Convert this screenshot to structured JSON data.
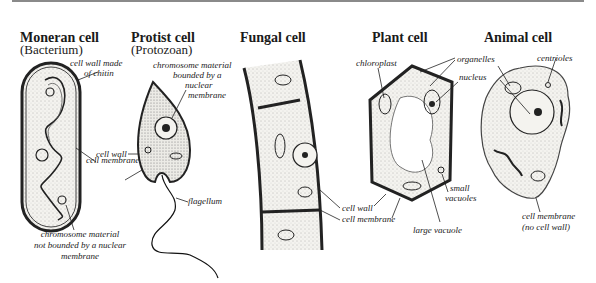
{
  "figure": {
    "panels": [
      {
        "title": "Moneran cell",
        "subtitle": "(Bacterium)",
        "labels": [
          "cell wall made",
          "of chitin",
          "chromosome material",
          "not bounded by a nuclear",
          "membrane"
        ]
      },
      {
        "title": "Protist cell",
        "subtitle": "(Protozoan)",
        "labels": [
          "chromosome material",
          "bounded by a",
          "nuclear",
          "membrane",
          "cell wall",
          "cell membrane",
          "flagellum"
        ]
      },
      {
        "title": "Fungal cell",
        "labels": [
          "cell wall",
          "cell membrane"
        ]
      },
      {
        "title": "Plant cell",
        "labels": [
          "chloroplast",
          "organelles",
          "nucleus",
          "small",
          "vacuoles",
          "large vacuole"
        ]
      },
      {
        "title": "Animal cell",
        "labels": [
          "centrioles",
          "cell membrane",
          "(no cell wall)"
        ]
      }
    ]
  },
  "colors": {
    "ink": "#1a1a1a",
    "cytoplasm": "#ecebe6",
    "rule": "#8a8a8a"
  }
}
